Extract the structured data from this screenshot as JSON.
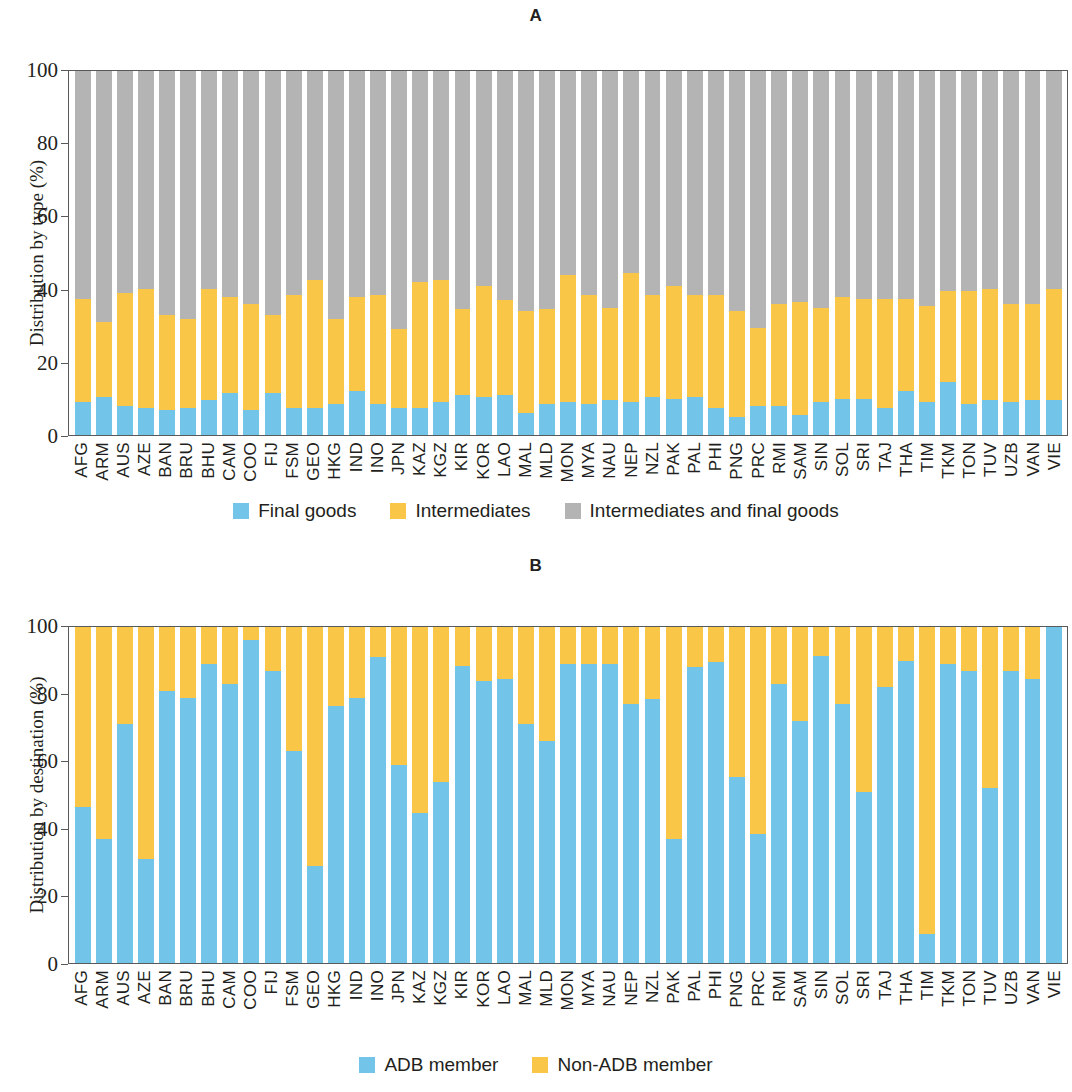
{
  "figure": {
    "panel_a_title": "A",
    "panel_b_title": "B"
  },
  "panel_a": {
    "ylabel": "Distribution by type (%)",
    "yticks": [
      "100",
      "80",
      "60",
      "40",
      "20",
      "0"
    ],
    "legend": [
      {
        "label": "Final goods",
        "color": "#72c5e8"
      },
      {
        "label": "Intermediates",
        "color": "#fac648"
      },
      {
        "label": "Intermediates and final goods",
        "color": "#b4b4b4"
      }
    ]
  },
  "panel_b": {
    "ylabel": "Distribution by destination (%)",
    "yticks": [
      "100",
      "80",
      "60",
      "40",
      "20",
      "0"
    ],
    "legend": [
      {
        "label": "ADB member",
        "color": "#72c5e8"
      },
      {
        "label": "Non-ADB member",
        "color": "#fac648"
      }
    ]
  },
  "chart_data": [
    {
      "type": "bar",
      "panel": "A",
      "title": "A",
      "stacked": true,
      "normalized_percent": true,
      "xlabel": "",
      "ylabel": "Distribution by type (%)",
      "ylim": [
        0,
        100
      ],
      "yticks": [
        0,
        20,
        40,
        60,
        80,
        100
      ],
      "grid": false,
      "legend_position": "bottom",
      "categories": [
        "AFG",
        "ARM",
        "AUS",
        "AZE",
        "BAN",
        "BRU",
        "BHU",
        "CAM",
        "COO",
        "FIJ",
        "FSM",
        "GEO",
        "HKG",
        "IND",
        "INO",
        "JPN",
        "KAZ",
        "KGZ",
        "KIR",
        "KOR",
        "LAO",
        "MAL",
        "MLD",
        "MON",
        "MYA",
        "NAU",
        "NEP",
        "NZL",
        "PAK",
        "PAL",
        "PHI",
        "PNG",
        "PRC",
        "RMI",
        "SAM",
        "SIN",
        "SOL",
        "SRI",
        "TAJ",
        "THA",
        "TIM",
        "TKM",
        "TON",
        "TUV",
        "UZB",
        "VAN",
        "VIE"
      ],
      "series": [
        {
          "name": "Final goods",
          "color": "#72c5e8",
          "values": [
            9,
            10.5,
            8,
            7.5,
            7,
            7.5,
            9.5,
            11.5,
            7,
            11.5,
            7.5,
            7.5,
            8.5,
            12,
            8.5,
            7.5,
            7.5,
            9,
            11,
            10.5,
            11,
            6,
            8.5,
            9,
            8.5,
            9.5,
            9,
            10.5,
            10,
            10.5,
            7.5,
            5,
            8,
            8,
            5.5,
            9,
            10,
            10,
            7.5,
            12,
            9,
            14.5,
            8.5,
            9.5,
            9,
            9.5,
            9.5
          ]
        },
        {
          "name": "Intermediates",
          "color": "#fac648",
          "values": [
            28.5,
            20.5,
            31,
            32.5,
            26,
            24.5,
            30.5,
            26.5,
            29,
            21.5,
            31,
            35,
            23.5,
            26,
            30,
            21.5,
            34.5,
            33.5,
            23.5,
            30.5,
            26,
            28,
            26,
            35,
            30,
            25.5,
            35.5,
            28,
            31,
            28,
            31,
            29,
            21.5,
            28,
            31,
            26,
            28,
            27.5,
            30,
            25.5,
            26.5,
            25,
            31,
            30.5,
            27,
            26.5,
            30.5
          ]
        },
        {
          "name": "Intermediates and final goods",
          "color": "#b4b4b4",
          "values": [
            62.5,
            69,
            61,
            60,
            67,
            68,
            60,
            62,
            64,
            67,
            61.5,
            57.5,
            68,
            62,
            61.5,
            71,
            58,
            57.5,
            65.5,
            59,
            63,
            66,
            65.5,
            56,
            61.5,
            65,
            55.5,
            61.5,
            59,
            61.5,
            61.5,
            66,
            70.5,
            64,
            63.5,
            65,
            62,
            62.5,
            62.5,
            62.5,
            64.5,
            60.5,
            60.5,
            60,
            64,
            64,
            60
          ]
        }
      ]
    },
    {
      "type": "bar",
      "panel": "B",
      "title": "B",
      "stacked": true,
      "normalized_percent": true,
      "xlabel": "",
      "ylabel": "Distribution by destination (%)",
      "ylim": [
        0,
        100
      ],
      "yticks": [
        0,
        20,
        40,
        60,
        80,
        100
      ],
      "grid": false,
      "legend_position": "bottom",
      "categories": [
        "AFG",
        "ARM",
        "AUS",
        "AZE",
        "BAN",
        "BRU",
        "BHU",
        "CAM",
        "COO",
        "FIJ",
        "FSM",
        "GEO",
        "HKG",
        "IND",
        "INO",
        "JPN",
        "KAZ",
        "KGZ",
        "KIR",
        "KOR",
        "LAO",
        "MAL",
        "MLD",
        "MON",
        "MYA",
        "NAU",
        "NEP",
        "NZL",
        "PAK",
        "PAL",
        "PHI",
        "PNG",
        "PRC",
        "RMI",
        "SAM",
        "SIN",
        "SOL",
        "SRI",
        "TAJ",
        "THA",
        "TIM",
        "TKM",
        "TON",
        "TUV",
        "UZB",
        "VAN",
        "VIE"
      ],
      "series": [
        {
          "name": "ADB member",
          "color": "#72c5e8",
          "values": [
            46.5,
            37,
            71,
            31,
            81,
            79,
            89,
            83,
            96,
            87,
            63,
            29,
            76.5,
            79,
            91,
            59,
            44.5,
            54,
            88.5,
            84,
            84.5,
            71,
            66,
            89,
            89,
            89,
            77,
            78.5,
            37,
            88,
            89.5,
            55.5,
            38.5,
            83,
            72,
            91.5,
            77,
            51,
            82,
            90,
            8.5,
            89,
            87,
            52,
            87,
            84.5,
            100
          ]
        },
        {
          "name": "Non-ADB member",
          "color": "#fac648",
          "values": [
            53.5,
            63,
            29,
            69,
            19,
            21,
            11,
            17,
            4,
            13,
            37,
            71,
            23.5,
            21,
            9,
            41,
            55.5,
            46,
            11.5,
            16,
            15.5,
            29,
            34,
            11,
            11,
            11,
            23,
            21.5,
            63,
            12,
            10.5,
            44.5,
            61.5,
            17,
            28,
            8.5,
            23,
            49,
            18,
            10,
            91.5,
            11,
            13,
            48,
            13,
            15.5,
            0
          ]
        }
      ]
    }
  ]
}
